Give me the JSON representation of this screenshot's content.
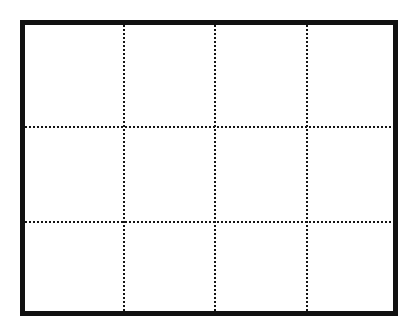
{
  "figure": {
    "kind": "empty-grid-table",
    "canvas": {
      "width": 418,
      "height": 332,
      "background_color": "#ffffff"
    },
    "frame": {
      "name": "table-outer-border",
      "style": "solid",
      "color": "#111111",
      "thickness_px": 5,
      "left": 20,
      "top": 20,
      "right": 398,
      "bottom": 316,
      "width": 378,
      "height": 296
    },
    "grid": {
      "rows": 3,
      "columns": 4,
      "cell_count": 12,
      "rule_style": "dotted",
      "rule_color": "#141414",
      "dot_size_px": 2,
      "dot_gap_px": 2,
      "vertical_rule_x": [
        99,
        190,
        282
      ],
      "horizontal_rule_y": [
        102,
        197
      ],
      "column_edges_x": [
        0,
        99,
        190,
        282,
        368
      ],
      "row_edges_y": [
        0,
        102,
        197,
        286
      ],
      "interior_width": 368,
      "interior_height": 286
    },
    "cells": [
      {
        "id": "r1c1",
        "row": 1,
        "col": 1,
        "label": ""
      },
      {
        "id": "r1c2",
        "row": 1,
        "col": 2,
        "label": ""
      },
      {
        "id": "r1c3",
        "row": 1,
        "col": 3,
        "label": ""
      },
      {
        "id": "r1c4",
        "row": 1,
        "col": 4,
        "label": ""
      },
      {
        "id": "r2c1",
        "row": 2,
        "col": 1,
        "label": ""
      },
      {
        "id": "r2c2",
        "row": 2,
        "col": 2,
        "label": ""
      },
      {
        "id": "r2c3",
        "row": 2,
        "col": 3,
        "label": ""
      },
      {
        "id": "r2c4",
        "row": 2,
        "col": 4,
        "label": ""
      },
      {
        "id": "r3c1",
        "row": 3,
        "col": 1,
        "label": ""
      },
      {
        "id": "r3c2",
        "row": 3,
        "col": 2,
        "label": ""
      },
      {
        "id": "r3c3",
        "row": 3,
        "col": 3,
        "label": ""
      },
      {
        "id": "r3c4",
        "row": 3,
        "col": 4,
        "label": ""
      }
    ]
  }
}
